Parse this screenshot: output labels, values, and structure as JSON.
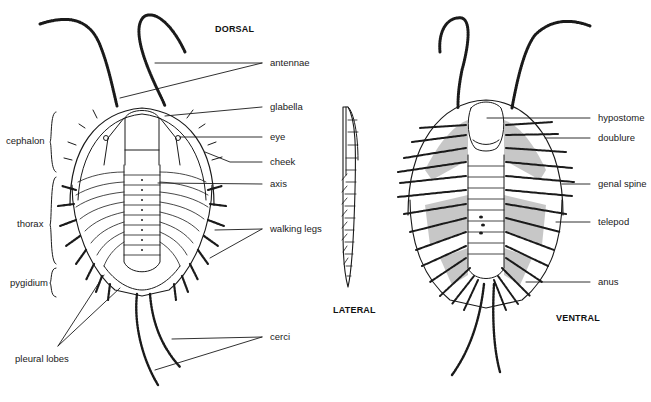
{
  "diagram": {
    "views": {
      "dorsal": "DORSAL",
      "lateral": "LATERAL",
      "ventral": "VENTRAL"
    },
    "dorsal_labels_right": [
      "antennae",
      "glabella",
      "eye",
      "cheek",
      "axis",
      "walking legs",
      "cerci"
    ],
    "dorsal_labels_left": [
      "cephalon",
      "thorax",
      "pygidium",
      "pleural lobes"
    ],
    "ventral_labels_right": [
      "hypostome",
      "doublure",
      "genal spine",
      "telepod",
      "anus"
    ],
    "colors": {
      "ink": "#1a1a1a",
      "background": "#ffffff",
      "shade": "#9a9a9a"
    }
  }
}
